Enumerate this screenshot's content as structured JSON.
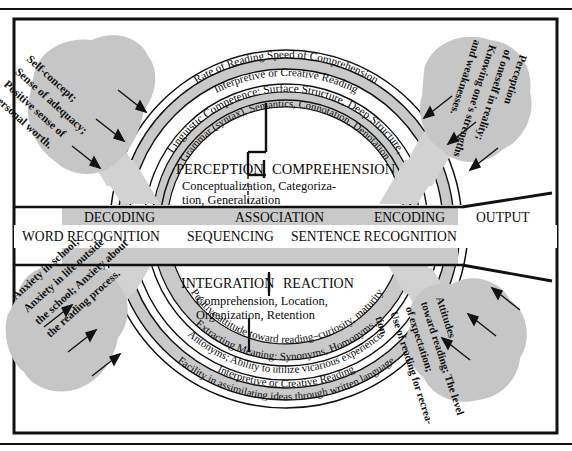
{
  "figure": {
    "frame_color": "#000000",
    "shade_color": "#c9c9c9",
    "blob_color": "#c6c6c6",
    "arrow_color": "#cfcfcf",
    "line_color": "#111111"
  },
  "core": {
    "upper_left_label": "PERCEPTION",
    "upper_right_label": "COMPREHENSION",
    "upper_sub_line1": "Conceptualization, Categoriza-",
    "upper_sub_line2": "tion, Generalization",
    "lower_left_label": "INTEGRATION",
    "lower_right_label": "REACTION",
    "lower_sub_line1": "Comprehension, Location,",
    "lower_sub_line2": "Organization, Retention"
  },
  "band": {
    "row1": [
      "DECODING",
      "ASSOCIATION",
      "ENCODING"
    ],
    "row2": [
      "WORD RECOGNITION",
      "SEQUENCING",
      "SENTENCE RECOGNITION"
    ],
    "output_label": "OUTPUT"
  },
  "arcs_upper": [
    {
      "id": "upper-ring-1",
      "text": "Grammar (syntax), Semantics, Connotation, Denotation."
    },
    {
      "id": "upper-ring-2",
      "text": "Linguistic Competence:  Surface Structure, Deep Structure,"
    },
    {
      "id": "upper-ring-3",
      "text": "Interpretive or Creative Reading"
    },
    {
      "id": "upper-ring-4",
      "text": "Rate of Reading                                   Speed of Comprehension"
    }
  ],
  "arcs_lower": [
    {
      "id": "lower-ring-0",
      "text": "Positive attitude toward reading–curiosity, maturity"
    },
    {
      "id": "lower-ring-1",
      "text": "Extracting Meaning:  Synonyms, Homonyms,"
    },
    {
      "id": "lower-ring-2",
      "text": "Antonyms; Ability to utilize vicarious experience."
    },
    {
      "id": "lower-ring-3",
      "text": "Interpretive or Creative Reading"
    },
    {
      "id": "lower-ring-4",
      "text": "Facility in assimilating ideas through written language"
    }
  ],
  "callouts": {
    "top_left": {
      "name": "self-concept-callout",
      "lines": [
        "Self-concept;",
        "Sense of adequacy;",
        "Positive sense of",
        "personal worth."
      ],
      "arrow_count": 3
    },
    "top_right": {
      "name": "perception-of-self-callout",
      "lines": [
        "Perception",
        "of oneself in reality;",
        "Knowing one's strengths",
        "and weaknesses."
      ],
      "arrow_count": 3
    },
    "bottom_left": {
      "name": "anxiety-callout",
      "lines": [
        "Anxiety in school;",
        "Anxiety in life outside",
        "the school; Anxiety about",
        "the reading process."
      ],
      "arrow_count": 3
    },
    "bottom_right": {
      "name": "attitudes-callout",
      "lines": [
        "Attitudes",
        "toward reading; The level",
        "of expectation;",
        "Use of reading for recrea-",
        "tion."
      ],
      "arrow_count": 3
    }
  }
}
